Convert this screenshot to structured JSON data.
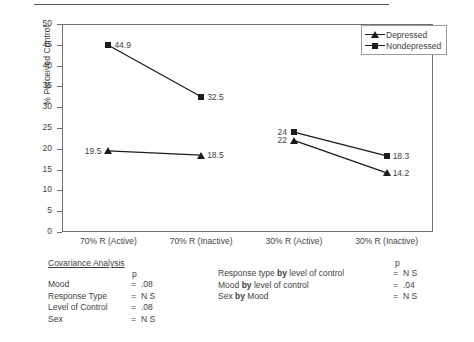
{
  "chart_data": {
    "type": "line",
    "title": "",
    "xlabel": "",
    "ylabel": "% Perceived Control",
    "categories": [
      "70% R (Active)",
      "70% R (Inactive)",
      "30% R (Active)",
      "30% R (Inactive)"
    ],
    "ylim": [
      0,
      50
    ],
    "yticks": [
      0,
      5,
      10,
      15,
      20,
      25,
      30,
      35,
      40,
      45,
      50
    ],
    "ytick_labels": [
      "0",
      "5",
      "10",
      "15",
      "20",
      "25",
      "30",
      "35",
      "40",
      "45",
      "50"
    ],
    "grid": false,
    "legend_position": "top-right",
    "series": [
      {
        "name": "Depressed",
        "marker": "triangle",
        "values": [
          19.5,
          18.5,
          22,
          14.2
        ],
        "point_labels": [
          "19.5",
          "18.5",
          "22",
          "14.2"
        ],
        "label_sides": [
          "left",
          "right",
          "left",
          "right"
        ]
      },
      {
        "name": "Nondepressed",
        "marker": "square",
        "values": [
          44.9,
          32.5,
          24,
          18.3
        ],
        "point_labels": [
          "44.9",
          "32.5",
          "24",
          "18.3"
        ],
        "label_sides": [
          "right",
          "right",
          "left",
          "right"
        ]
      }
    ],
    "segments": [
      [
        0,
        1
      ],
      [
        2,
        3
      ]
    ]
  },
  "legend": {
    "items": [
      {
        "label": "Depressed",
        "marker": "triangle"
      },
      {
        "label": "Nondepressed",
        "marker": "square"
      }
    ]
  },
  "stats_left": {
    "title": "Covariance Analysis",
    "p_header": "p",
    "rows": [
      {
        "name": "Mood",
        "eq": "=",
        "value": ".08"
      },
      {
        "name": "Response Type",
        "eq": "=",
        "value": "N S"
      },
      {
        "name": "Level of Control",
        "eq": "=",
        "value": ".08"
      },
      {
        "name": "Sex",
        "eq": "=",
        "value": "N S"
      }
    ]
  },
  "stats_right": {
    "p_header": "p",
    "rows": [
      {
        "pre": "Response type",
        "by": "by",
        "post": "level of control",
        "eq": "=",
        "value": "N S"
      },
      {
        "pre": "Mood",
        "by": "by",
        "post": "level of control",
        "eq": "=",
        "value": ".04"
      },
      {
        "pre": "Sex",
        "by": "by",
        "post": "Mood",
        "eq": "=",
        "value": "N S"
      }
    ]
  }
}
